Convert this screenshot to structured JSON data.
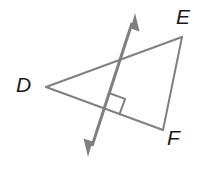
{
  "figure": {
    "kind": "geometry-diagram",
    "width": 216,
    "height": 183,
    "background_color": "#ffffff",
    "stroke_color": "#808080",
    "label_color": "#1a1a1a",
    "stroke_width": 2,
    "transversal_stroke_width": 3
  },
  "labels": {
    "d": "D",
    "e": "E",
    "f": "F"
  },
  "geometry": {
    "vertices": {
      "D": {
        "x": 46,
        "y": 87
      },
      "E": {
        "x": 182,
        "y": 37
      },
      "F": {
        "x": 163,
        "y": 130
      }
    },
    "sides": [
      {
        "name": "DE",
        "from": "D",
        "to": "E"
      },
      {
        "name": "EF",
        "from": "E",
        "to": "F"
      },
      {
        "name": "DF",
        "from": "D",
        "to": "F"
      }
    ],
    "transversal": {
      "name": "transversal-line",
      "arrow_start": {
        "x": 88,
        "y": 157
      },
      "arrow_end": {
        "x": 135,
        "y": 13
      },
      "double_headed": true
    },
    "right_angle_marker": {
      "name": "right-angle-marker",
      "at_intersection_of": [
        "DF",
        "transversal"
      ],
      "corner": {
        "x": 108,
        "y": 108
      },
      "size": 15
    },
    "intersections": [
      {
        "lines": [
          "DE",
          "transversal"
        ],
        "x": 124,
        "y": 56
      },
      {
        "lines": [
          "DF",
          "transversal"
        ],
        "x": 108,
        "y": 108
      }
    ]
  }
}
